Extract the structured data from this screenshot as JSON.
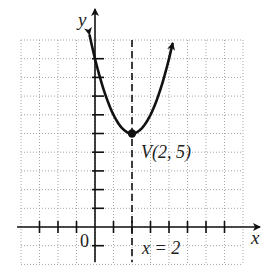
{
  "chart_data": {
    "type": "line",
    "title": "",
    "xlabel": "x",
    "ylabel": "y",
    "xlim": [
      -4,
      8
    ],
    "ylim": [
      -2,
      10
    ],
    "grid": true,
    "grid_style": "dotted",
    "function": "y = (x - 2)^2 + 5",
    "series": [
      {
        "name": "parabola",
        "x": [
          -0.3,
          0,
          0.5,
          1,
          1.5,
          2,
          2.5,
          3,
          3.5,
          4,
          4.2
        ],
        "y": [
          10.29,
          9,
          7.25,
          6,
          5.25,
          5,
          5.25,
          6,
          7.25,
          9,
          9.84
        ],
        "arrows_both_ends": true
      }
    ],
    "axis_of_symmetry": {
      "x": 2,
      "style": "dashed",
      "label": "x = 2"
    },
    "vertex": {
      "x": 2,
      "y": 5,
      "label": "V(2, 5)"
    },
    "x_ticks": [
      -3,
      -2,
      -1,
      1,
      2,
      3,
      4,
      5,
      6,
      7
    ],
    "y_ticks": [
      -1,
      1,
      2,
      3,
      4,
      5,
      6,
      7,
      8,
      9
    ],
    "origin_label": "0",
    "annotations": [
      "V(2, 5)",
      "x = 2"
    ]
  },
  "labels": {
    "x_axis": "x",
    "y_axis": "y",
    "origin": "0",
    "vertex": "V(2, 5)",
    "symmetry": "x = 2"
  },
  "colors": {
    "curve": "#111111",
    "axis": "#111111",
    "grid": "#9a9a9a"
  }
}
